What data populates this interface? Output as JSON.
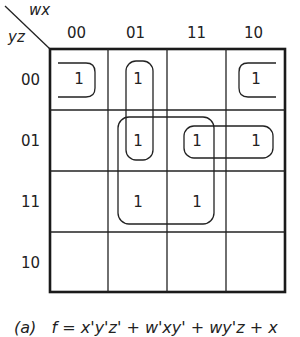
{
  "map": {
    "row_var": "yz",
    "col_var": "wx",
    "col_labels": [
      "00",
      "01",
      "11",
      "10"
    ],
    "row_labels": [
      "00",
      "01",
      "11",
      "10"
    ],
    "cells": [
      [
        "1",
        "1",
        "",
        "1"
      ],
      [
        "",
        "1",
        "1",
        "1"
      ],
      [
        "",
        "1",
        "1",
        ""
      ],
      [
        "",
        "",
        "",
        ""
      ]
    ],
    "groupings": [
      {
        "term": "x'y'z'",
        "cells": [
          [
            0,
            0
          ],
          [
            0,
            3
          ]
        ],
        "wrap": true
      },
      {
        "term": "w'xy'",
        "cells": [
          [
            0,
            1
          ],
          [
            1,
            1
          ]
        ]
      },
      {
        "term": "xz",
        "cells": [
          [
            1,
            1
          ],
          [
            1,
            2
          ],
          [
            2,
            1
          ],
          [
            2,
            2
          ]
        ]
      },
      {
        "term": "wy'z",
        "cells": [
          [
            1,
            2
          ],
          [
            1,
            3
          ]
        ]
      }
    ]
  },
  "caption": {
    "label": "(a)",
    "expression": "f = x'y'z' + w'xy' + wy'z + x"
  }
}
